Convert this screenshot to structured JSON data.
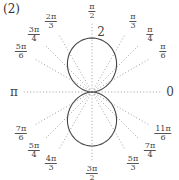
{
  "caption": "(2)",
  "chart_data": {
    "type": "line",
    "coordinate_system": "polar",
    "title": "",
    "curve_description": "two-lobed closed curve symmetric about the vertical axis, lobes meeting at the pole, maximum r = 2 at θ = π/2 and θ = 3π/2",
    "r_max_label": "2",
    "r_range": [
      0,
      2
    ],
    "series": [
      {
        "name": "curve",
        "theta_deg": [
          0,
          15,
          30,
          45,
          60,
          75,
          90,
          105,
          120,
          135,
          150,
          165,
          180,
          195,
          210,
          225,
          240,
          255,
          270,
          285,
          300,
          315,
          330,
          345,
          360
        ],
        "r": [
          0,
          0.35,
          0.75,
          1.2,
          1.6,
          1.9,
          2.0,
          1.9,
          1.6,
          1.2,
          0.75,
          0.35,
          0,
          0.35,
          0.75,
          1.2,
          1.6,
          1.9,
          2.0,
          1.9,
          1.6,
          1.2,
          0.75,
          0.35,
          0
        ]
      }
    ],
    "angle_ticks": [
      {
        "deg": 0,
        "label": "0",
        "kind": "plain"
      },
      {
        "deg": 30,
        "num": "π",
        "den": "6",
        "kind": "frac"
      },
      {
        "deg": 45,
        "num": "π",
        "den": "4",
        "kind": "frac"
      },
      {
        "deg": 60,
        "num": "π",
        "den": "3",
        "kind": "frac"
      },
      {
        "deg": 90,
        "num": "π",
        "den": "2",
        "kind": "frac"
      },
      {
        "deg": 120,
        "num": "2π",
        "den": "3",
        "kind": "frac"
      },
      {
        "deg": 135,
        "num": "3π",
        "den": "4",
        "kind": "frac"
      },
      {
        "deg": 150,
        "num": "5π",
        "den": "6",
        "kind": "frac"
      },
      {
        "deg": 180,
        "label": "π",
        "kind": "plain"
      },
      {
        "deg": 210,
        "num": "7π",
        "den": "6",
        "kind": "frac"
      },
      {
        "deg": 225,
        "num": "5π",
        "den": "4",
        "kind": "frac"
      },
      {
        "deg": 240,
        "num": "4π",
        "den": "3",
        "kind": "frac"
      },
      {
        "deg": 270,
        "num": "3π",
        "den": "2",
        "kind": "frac"
      },
      {
        "deg": 300,
        "num": "5π",
        "den": "3",
        "kind": "frac"
      },
      {
        "deg": 315,
        "num": "7π",
        "den": "4",
        "kind": "frac"
      },
      {
        "deg": 330,
        "num": "11π",
        "den": "6",
        "kind": "frac"
      }
    ],
    "grid": "dotted radial lines at each labeled angle",
    "legend": "none"
  }
}
